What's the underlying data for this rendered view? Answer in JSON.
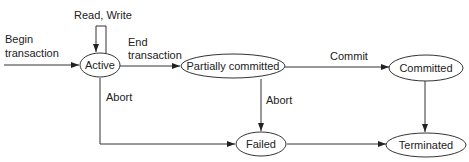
{
  "diagram": {
    "type": "state-transition",
    "colors": {
      "line": "#333333",
      "text": "#222222",
      "background": "#ffffff"
    },
    "nodes": {
      "active": {
        "label": "Active"
      },
      "partially_committed": {
        "label": "Partially committed"
      },
      "committed": {
        "label": "Committed"
      },
      "failed": {
        "label": "Failed"
      },
      "terminated": {
        "label": "Terminated"
      }
    },
    "edges": {
      "begin": {
        "line1": "Begin",
        "line2": "transaction",
        "from": "start",
        "to": "Active"
      },
      "read_write": {
        "label": "Read, Write",
        "from": "Active",
        "to": "Active"
      },
      "end": {
        "line1": "End",
        "line2": "transaction",
        "from": "Active",
        "to": "Partially committed"
      },
      "commit": {
        "label": "Commit",
        "from": "Partially committed",
        "to": "Committed"
      },
      "abort_active": {
        "label": "Abort",
        "from": "Active",
        "to": "Failed"
      },
      "abort_partial": {
        "label": "Abort",
        "from": "Partially committed",
        "to": "Failed"
      },
      "failed_terminated": {
        "label": "",
        "from": "Failed",
        "to": "Terminated"
      },
      "committed_terminated": {
        "label": "",
        "from": "Committed",
        "to": "Terminated"
      }
    }
  }
}
